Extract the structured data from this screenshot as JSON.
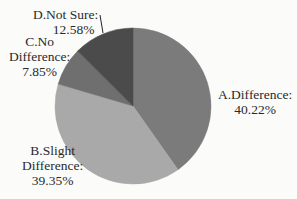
{
  "chart_data": {
    "type": "pie",
    "title": "",
    "start_angle": "top",
    "direction": "clockwise",
    "categories": [
      "A.Difference",
      "B.Slight Difference",
      "C.No Difference",
      "D.Not Sure"
    ],
    "values": [
      40.22,
      39.35,
      7.85,
      12.58
    ],
    "unit": "%",
    "colors": [
      "#7b7b7b",
      "#a9a9a9",
      "#6f6f6f",
      "#4b4b4b"
    ],
    "legend": "none",
    "data_labels": [
      {
        "name": "A.Difference:",
        "value": "40.22%"
      },
      {
        "name_line1": "B.Slight",
        "name_line2": "Difference:",
        "value": "39.35%"
      },
      {
        "name_line1": "C.No",
        "name_line2": "Difference:",
        "value": "7.85%"
      },
      {
        "name": "D.Not Sure:",
        "value": "12.58%"
      }
    ]
  }
}
